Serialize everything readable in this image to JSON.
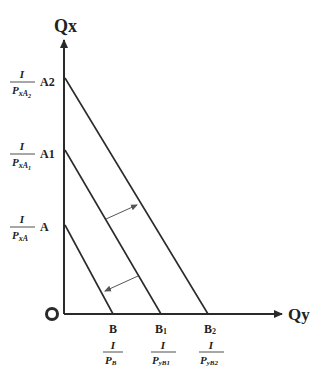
{
  "diagram": {
    "type": "budget-line-shift",
    "axes": {
      "y_label": "Qx",
      "x_label": "Qy",
      "origin_label": "O"
    },
    "y_intercepts": [
      {
        "id": "A2",
        "label": "A2",
        "frac_num": "I",
        "frac_den": "P",
        "frac_den_sub": "xA",
        "frac_den_sub2": "2"
      },
      {
        "id": "A1",
        "label": "A1",
        "frac_num": "I",
        "frac_den": "P",
        "frac_den_sub": "xA",
        "frac_den_sub2": "1"
      },
      {
        "id": "A",
        "label": "A",
        "frac_num": "I",
        "frac_den": "P",
        "frac_den_sub": "xA",
        "frac_den_sub2": ""
      }
    ],
    "x_intercepts": [
      {
        "id": "B",
        "label": "B",
        "label_sub": "",
        "frac_num": "I",
        "frac_den": "P",
        "frac_den_sub": "B"
      },
      {
        "id": "B1",
        "label": "B",
        "label_sub": "1",
        "frac_num": "I",
        "frac_den": "P",
        "frac_den_sub": "yB1"
      },
      {
        "id": "B2",
        "label": "B",
        "label_sub": "2",
        "frac_num": "I",
        "frac_den": "P",
        "frac_den_sub": "yB2"
      }
    ],
    "lines": [
      {
        "name": "budget-line-AB",
        "from": "A",
        "to": "B"
      },
      {
        "name": "budget-line-A1B1",
        "from": "A1",
        "to": "B1"
      },
      {
        "name": "budget-line-A2B2",
        "from": "A2",
        "to": "B2"
      }
    ],
    "shift_arrows": [
      {
        "name": "outward-shift-arrow",
        "from_line": "A1B1",
        "to_line": "A2B2"
      },
      {
        "name": "inward-shift-arrow",
        "from_line": "A1B1",
        "to_line": "AB"
      }
    ],
    "colors": {
      "line": "#2a2a2a",
      "arrow": "#555555",
      "background": "#ffffff"
    }
  }
}
